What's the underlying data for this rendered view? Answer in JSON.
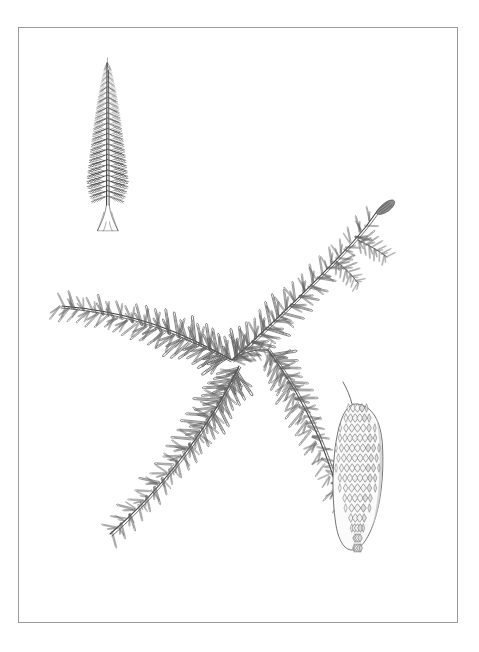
{
  "page": {
    "background_color": "#ffffff",
    "width": 479,
    "height": 652,
    "medium": "pen-and-ink botanical illustration",
    "caption": ""
  },
  "border": {
    "name": "plate-border",
    "color": "#9a9a9a",
    "stroke_width": 1,
    "x": 18,
    "y": 27,
    "width": 439,
    "height": 595
  },
  "ink": {
    "line_color": "#4a4a4a",
    "dark_color": "#2b2b2b",
    "shade_color": "#8d8d8d",
    "light_color": "#b5b5b5"
  },
  "figures": [
    {
      "id": "habit-tree",
      "label": "whole tree habit sketch",
      "description": "narrow spire-shaped conifer with whorled drooping branches, bare lower trunk and flared buttressed base",
      "x": 72,
      "y": 58,
      "width": 70,
      "height": 180,
      "whorl_count": 26,
      "trunk_color": "#3a3a3a"
    },
    {
      "id": "branch-spray",
      "label": "needled branch spray",
      "description": "three-part branch: upper-right leader with terminal bud, left horizontal lateral, and lower-left descending lateral; needles drawn as fine outlined double strokes",
      "x": 42,
      "y": 196,
      "width": 360,
      "height": 380,
      "needle_count": 340
    },
    {
      "id": "seed-cone",
      "label": "pendulous seed cone",
      "description": "elongate cylindric hanging cone with overlapping diamond-shaped scales, rounded apex",
      "x": 335,
      "y": 404,
      "width": 48,
      "height": 150,
      "scale_rows": 15
    },
    {
      "id": "terminal-bud",
      "label": "terminal bud at branch apex",
      "x": 374,
      "y": 203,
      "width": 22,
      "height": 14
    }
  ]
}
